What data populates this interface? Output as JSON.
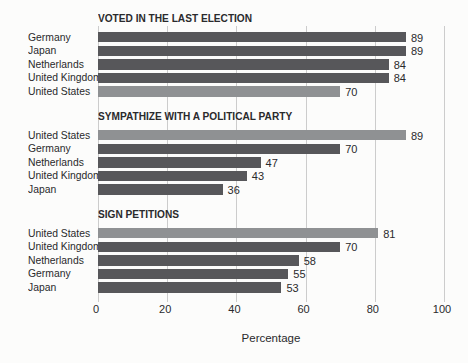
{
  "page": {
    "background_color": "#fcfcfb"
  },
  "chart_data": {
    "type": "bar",
    "orientation": "horizontal",
    "title": "",
    "xlabel": "Percentage",
    "ylabel": "",
    "xlim": [
      0,
      100
    ],
    "x_ticks": [
      0,
      20,
      40,
      60,
      80,
      100
    ],
    "grid": true,
    "legend": "none",
    "colors": {
      "bar_default": "#57575a",
      "bar_highlight": "#8f9193",
      "gridline": "#cccccc",
      "text": "#2a2a2c"
    },
    "sections": [
      {
        "title": "VOTED IN THE LAST ELECTION",
        "rows": [
          {
            "label": "Germany",
            "value": 89,
            "highlight": false
          },
          {
            "label": "Japan",
            "value": 89,
            "highlight": false
          },
          {
            "label": "Netherlands",
            "value": 84,
            "highlight": false
          },
          {
            "label": "United Kingdom",
            "value": 84,
            "highlight": false
          },
          {
            "label": "United States",
            "value": 70,
            "highlight": true
          }
        ]
      },
      {
        "title": "SYMPATHIZE WITH A POLITICAL PARTY",
        "rows": [
          {
            "label": "United States",
            "value": 89,
            "highlight": true
          },
          {
            "label": "Germany",
            "value": 70,
            "highlight": false
          },
          {
            "label": "Netherlands",
            "value": 47,
            "highlight": false
          },
          {
            "label": "United Kingdom",
            "value": 43,
            "highlight": false
          },
          {
            "label": "Japan",
            "value": 36,
            "highlight": false
          }
        ]
      },
      {
        "title": "SIGN PETITIONS",
        "rows": [
          {
            "label": "United States",
            "value": 81,
            "highlight": true
          },
          {
            "label": "United Kingdom",
            "value": 70,
            "highlight": false
          },
          {
            "label": "Netherlands",
            "value": 58,
            "highlight": false
          },
          {
            "label": "Germany",
            "value": 55,
            "highlight": false
          },
          {
            "label": "Japan",
            "value": 53,
            "highlight": false
          }
        ]
      }
    ]
  }
}
